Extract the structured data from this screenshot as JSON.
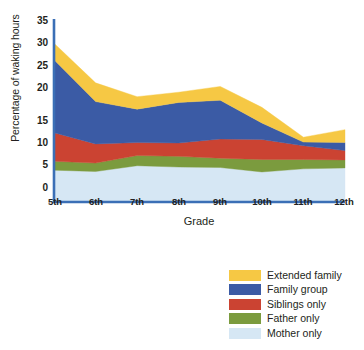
{
  "chart_data": {
    "type": "area",
    "stacked": true,
    "title": "",
    "xlabel": "Grade",
    "ylabel": "Percentage of waking hours",
    "categories": [
      "5th",
      "6th",
      "7th",
      "8th",
      "9th",
      "10th",
      "11th",
      "12th"
    ],
    "x": [
      "5th",
      "6th",
      "7th",
      "8th",
      "9th",
      "10th",
      "11th",
      "12th"
    ],
    "ylim": [
      -3,
      35
    ],
    "yticks": [
      0,
      5,
      10,
      15,
      20,
      25,
      30,
      35
    ],
    "grid": false,
    "legend_position": "bottom-right",
    "series": [
      {
        "name": "Mother only",
        "color": "#D6E7F4",
        "values": [
          4.0,
          3.7,
          5.0,
          4.7,
          4.6,
          3.6,
          4.3,
          4.5
        ]
      },
      {
        "name": "Father only",
        "color": "#7B9B3E",
        "values": [
          2.0,
          1.9,
          2.3,
          2.4,
          2.1,
          2.8,
          2.1,
          1.8
        ]
      },
      {
        "name": "Siblings only",
        "color": "#CB4332",
        "values": [
          6.4,
          4.3,
          2.9,
          3.0,
          4.3,
          4.5,
          3.1,
          2.1
        ]
      },
      {
        "name": "Family group",
        "color": "#3B5BA5",
        "values": [
          16.4,
          9.5,
          7.5,
          9.1,
          8.7,
          3.7,
          0.8,
          1.8
        ]
      },
      {
        "name": "Extended family",
        "color": "#F6C844",
        "values": [
          3.7,
          4.2,
          2.8,
          2.3,
          3.1,
          3.5,
          1.1,
          2.9
        ]
      }
    ],
    "series_order_bottom_to_top": [
      "Mother only",
      "Father only",
      "Siblings only",
      "Family group",
      "Extended family"
    ],
    "totals": [
      32.5,
      23.6,
      20.5,
      21.5,
      22.8,
      18.1,
      11.4,
      13.1
    ]
  },
  "axes": {
    "y_title": "Percentage of waking hours",
    "x_title": "Grade",
    "y_tick_labels": [
      "35",
      "30",
      "25",
      "20",
      "15",
      "10",
      "5",
      "0"
    ],
    "x_tick_labels": [
      "5th",
      "6th",
      "7th",
      "8th",
      "9th",
      "10th",
      "11th",
      "12th"
    ],
    "axis_color": "#3B6FB6"
  },
  "legend": {
    "items": [
      {
        "label": "Extended family",
        "color": "#F6C844"
      },
      {
        "label": "Family group",
        "color": "#3B5BA5"
      },
      {
        "label": "Siblings only",
        "color": "#CB4332"
      },
      {
        "label": "Father only",
        "color": "#7B9B3E"
      },
      {
        "label": "Mother only",
        "color": "#D6E7F4"
      }
    ]
  }
}
